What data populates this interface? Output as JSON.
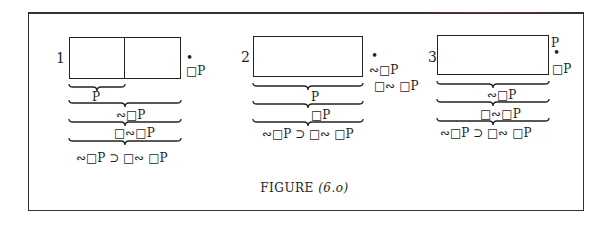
{
  "figure": {
    "caption": "FIGURE",
    "caption_number": "(6.o)",
    "panels": [
      {
        "number": "1",
        "side_labels": [
          "•",
          "□P"
        ],
        "brace_labels": [
          "P",
          "∾□P",
          "□∾□P"
        ],
        "formula": "∾□P ⊃ □∾ □P"
      },
      {
        "number": "2",
        "side_labels": [
          "•",
          "∾□P",
          "□∾ □P"
        ],
        "brace_labels": [
          "P",
          "□P"
        ],
        "formula": "∾□P ⊃ □∾ □P"
      },
      {
        "number": "3",
        "side_labels": [
          "P",
          "•",
          "□P"
        ],
        "brace_labels": [
          "∾□P",
          "□∾□P"
        ],
        "formula": "∾□P ⊃ □∾ □P"
      }
    ]
  }
}
